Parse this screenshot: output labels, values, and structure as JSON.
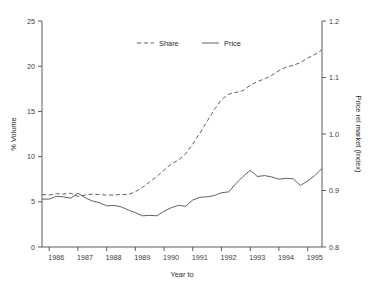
{
  "chart_data": {
    "type": "line",
    "title": "",
    "xlabel": "Year to",
    "ylabel": "% Volume",
    "y2label": "Price rel market (Index)",
    "grid": false,
    "legend_position": "top-center",
    "xlim": [
      1985.75,
      1995.5
    ],
    "ylim": [
      0,
      25
    ],
    "y2lim": [
      0.8,
      1.2
    ],
    "xticks": [
      1986,
      1987,
      1988,
      1989,
      1990,
      1991,
      1992,
      1993,
      1994,
      1995
    ],
    "xtick_labels": [
      "1986",
      "1987",
      "1988",
      "1989",
      "1990",
      "1991",
      "1992",
      "1993",
      "1994",
      "1995"
    ],
    "yticks": [
      0,
      5,
      10,
      15,
      20,
      25
    ],
    "ytick_labels": [
      "0",
      "5",
      "10",
      "15",
      "20",
      "25"
    ],
    "y2ticks": [
      0.8,
      0.9,
      1.0,
      1.1,
      1.2
    ],
    "y2tick_labels": [
      "0.8",
      "0.9",
      "1.0",
      "1.1",
      "1.2"
    ],
    "x": [
      1985.75,
      1986.0,
      1986.25,
      1986.5,
      1986.75,
      1987.0,
      1987.25,
      1987.5,
      1987.75,
      1988.0,
      1988.25,
      1988.5,
      1988.75,
      1989.0,
      1989.25,
      1989.5,
      1989.75,
      1990.0,
      1990.25,
      1990.5,
      1990.75,
      1991.0,
      1991.25,
      1991.5,
      1991.75,
      1992.0,
      1992.25,
      1992.5,
      1992.75,
      1993.0,
      1993.25,
      1993.5,
      1993.75,
      1994.0,
      1994.25,
      1994.5,
      1994.75,
      1995.0,
      1995.25,
      1995.5
    ],
    "series": [
      {
        "name": "Share",
        "axis": "left",
        "style": "dashed",
        "color": "#585858",
        "values": [
          5.8,
          5.75,
          5.9,
          5.85,
          5.95,
          5.6,
          5.75,
          5.85,
          5.8,
          5.75,
          5.75,
          5.8,
          5.8,
          6.1,
          6.6,
          7.2,
          7.8,
          8.5,
          9.2,
          9.6,
          10.3,
          11.4,
          12.6,
          13.9,
          15.2,
          16.3,
          16.9,
          17.1,
          17.3,
          17.9,
          18.3,
          18.6,
          19.0,
          19.5,
          19.9,
          20.1,
          20.4,
          20.9,
          21.3,
          21.8
        ]
      },
      {
        "name": "Price",
        "axis": "right",
        "style": "solid",
        "color": "#585858",
        "values": [
          5.3,
          5.3,
          5.6,
          5.55,
          5.4,
          5.95,
          5.45,
          5.1,
          4.9,
          4.55,
          4.6,
          4.45,
          4.1,
          3.8,
          3.45,
          3.5,
          3.45,
          3.95,
          4.35,
          4.6,
          4.5,
          5.2,
          5.5,
          5.55,
          5.7,
          6.0,
          6.1,
          7.0,
          7.8,
          8.5,
          7.8,
          7.9,
          7.75,
          7.5,
          7.6,
          7.55,
          6.8,
          7.3,
          7.9,
          8.7
        ]
      }
    ],
    "price_index_values": [
      0.885,
      0.885,
      0.89,
      0.889,
      0.886,
      0.895,
      0.887,
      0.882,
      0.878,
      0.873,
      0.874,
      0.871,
      0.866,
      0.861,
      0.855,
      0.856,
      0.855,
      0.863,
      0.87,
      0.874,
      0.872,
      0.883,
      0.888,
      0.889,
      0.891,
      0.896,
      0.898,
      0.912,
      0.925,
      0.936,
      0.925,
      0.926,
      0.924,
      0.92,
      0.922,
      0.921,
      0.909,
      0.917,
      0.926,
      0.939
    ]
  },
  "legend": {
    "items": [
      {
        "label": "Share",
        "style": "dashed"
      },
      {
        "label": "Price",
        "style": "solid"
      }
    ]
  },
  "axes": {
    "left_title": "% Volume",
    "right_title": "Price rel market (Index)",
    "bottom_title": "Year to"
  }
}
